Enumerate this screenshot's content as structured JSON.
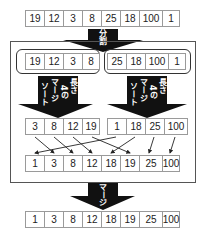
{
  "input_array": [
    "19",
    "12",
    "3",
    "8",
    "25",
    "18",
    "100",
    "1"
  ],
  "split_label": [
    "分",
    "割"
  ],
  "halves": {
    "left": [
      "19",
      "12",
      "3",
      "8"
    ],
    "right": [
      "25",
      "18",
      "100",
      "1"
    ]
  },
  "sort_label_columns": [
    "長さ",
    "4の",
    "マージ",
    "ソート"
  ],
  "sorted_halves": {
    "left": [
      "3",
      "8",
      "12",
      "19"
    ],
    "right": [
      "1",
      "18",
      "25",
      "100"
    ]
  },
  "merge_mapping": [
    {
      "from": "left.0",
      "value": "3",
      "to_index": 1
    },
    {
      "from": "left.1",
      "value": "8",
      "to_index": 2
    },
    {
      "from": "left.2",
      "value": "12",
      "to_index": 3
    },
    {
      "from": "left.3",
      "value": "19",
      "to_index": 5
    },
    {
      "from": "right.0",
      "value": "1",
      "to_index": 0
    },
    {
      "from": "right.1",
      "value": "18",
      "to_index": 4
    },
    {
      "from": "right.2",
      "value": "25",
      "to_index": 6
    },
    {
      "from": "right.3",
      "value": "100",
      "to_index": 7
    }
  ],
  "merged_array": [
    "1",
    "3",
    "8",
    "12",
    "18",
    "19",
    "25",
    "100"
  ],
  "merge_label": [
    "マ",
    "ー",
    "ジ"
  ],
  "output_array": [
    "1",
    "3",
    "8",
    "12",
    "18",
    "19",
    "25",
    "100"
  ],
  "colors": {
    "arrow": "#111111",
    "border": "#9a9a9a",
    "frame": "#555555"
  }
}
